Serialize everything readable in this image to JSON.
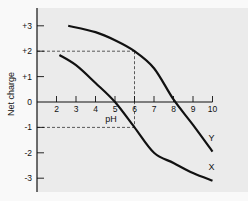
{
  "chart_data": {
    "type": "line",
    "title": "",
    "xlabel": "pH",
    "ylabel": "Net charge",
    "xlim": [
      1,
      10
    ],
    "ylim": [
      -3.5,
      3.5
    ],
    "grid": false,
    "x_ticks": [
      2,
      3,
      4,
      5,
      6,
      7,
      8,
      9,
      10
    ],
    "y_ticks": [
      3,
      2,
      1,
      0,
      -1,
      -2,
      -3
    ],
    "y_tick_labels": [
      "+3",
      "+2",
      "+1",
      "0",
      "-1",
      "-2",
      "-3"
    ],
    "series": [
      {
        "name": "Y",
        "points": [
          [
            2.6,
            3.0
          ],
          [
            4,
            2.75
          ],
          [
            5,
            2.43
          ],
          [
            6,
            2.0
          ],
          [
            7,
            1.33
          ],
          [
            8,
            0.1
          ],
          [
            9,
            -0.9
          ],
          [
            10,
            -1.95
          ]
        ]
      },
      {
        "name": "X",
        "points": [
          [
            2.15,
            1.85
          ],
          [
            3,
            1.45
          ],
          [
            4,
            0.75
          ],
          [
            5,
            0.0
          ],
          [
            6,
            -1.0
          ],
          [
            7,
            -2.0
          ],
          [
            8,
            -2.4
          ],
          [
            9,
            -2.8
          ],
          [
            10,
            -3.1
          ]
        ]
      }
    ],
    "reference_lines": [
      {
        "type": "horizontal",
        "y": 2,
        "x_to": 6,
        "style": "dashed"
      },
      {
        "type": "horizontal",
        "y": -1,
        "x_to": 6,
        "style": "dashed"
      },
      {
        "type": "vertical",
        "x": 6,
        "y_from": -1,
        "y_to": 2,
        "style": "dashed"
      }
    ],
    "legend": "inline labels at curve ends",
    "colors": {
      "plot_background": "#ebebeb",
      "page_background": "#f9f9f9",
      "line": "#111111"
    }
  }
}
